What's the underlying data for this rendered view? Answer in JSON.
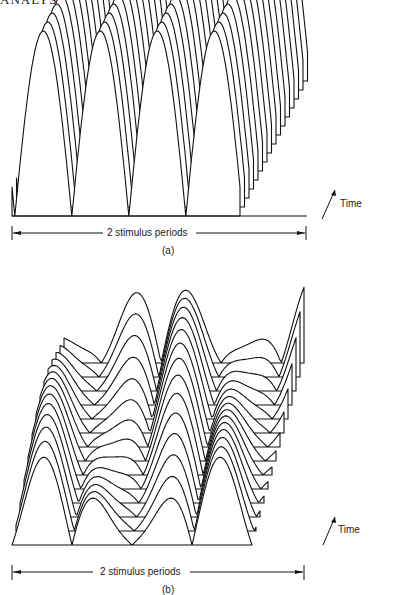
{
  "page": {
    "running_head": "ANALYSIS OF THE PERIODIC RESPONSE"
  },
  "figures": [
    {
      "id": "a",
      "caption": "(a)",
      "span_label": "2 stimulus periods",
      "time_label": "Time",
      "description": "Waterfall plot of rectified sinusoidal response over 2 stimulus periods, successive traces offset up-and-right in time"
    },
    {
      "id": "b",
      "caption": "(b)",
      "span_label": "2 stimulus periods",
      "time_label": "Time",
      "description": "Waterfall plot of modulated (multi-peaked) response over 2 stimulus periods, successive traces offset up-and-right in time"
    }
  ],
  "chart_data": [
    {
      "type": "area",
      "title": "(a)",
      "xlabel": "2 stimulus periods",
      "zlabel": "Time",
      "style": "waterfall / 3-D stacked traces",
      "traces": 16,
      "trace_offset_px": {
        "dx": 4.5,
        "dy": -9
      },
      "waveform": "half-wave rectified sine, 2 periods"
    },
    {
      "type": "area",
      "title": "(b)",
      "xlabel": "2 stimulus periods",
      "zlabel": "Time",
      "style": "waterfall / 3-D stacked traces",
      "traces": 14,
      "trace_offset_px": {
        "dx": 4,
        "dy": -14
      },
      "waveform": "rectified sine with slow amplitude modulation, 2 periods"
    }
  ]
}
